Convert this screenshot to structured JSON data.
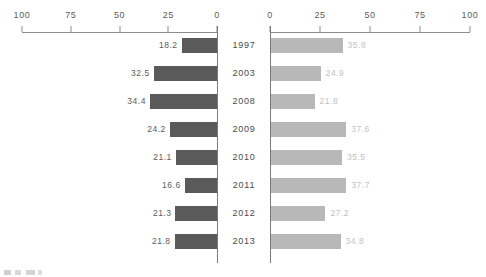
{
  "chart_data": {
    "type": "bar",
    "orientation": "horizontal-diverging",
    "title": "",
    "subtitle": "",
    "xlabel": "",
    "ylabel": "",
    "categories": [
      "1997",
      "2003",
      "2008",
      "2009",
      "2010",
      "2011",
      "2012",
      "2013"
    ],
    "series": [
      {
        "name": "left",
        "side": "left",
        "color": "#5a5a5a",
        "label_color": "#5c5c5c",
        "values": [
          18.2,
          32.5,
          34.4,
          24.2,
          21.1,
          16.6,
          21.3,
          21.8
        ],
        "value_labels": [
          "18.2",
          "32.5",
          "34.4",
          "24.2",
          "21.1",
          "16.6",
          "21.3",
          "21.8"
        ],
        "axis": {
          "min": 0,
          "max": 100,
          "direction": "right-to-left",
          "ticks": [
            100,
            75,
            50,
            25,
            0
          ],
          "tick_labels": [
            "100",
            "75",
            "50",
            "25",
            "0"
          ]
        }
      },
      {
        "name": "right",
        "side": "right",
        "color": "#b8b8b8",
        "label_color": "#c2c2c2",
        "values": [
          35.8,
          24.9,
          21.8,
          37.6,
          35.5,
          37.7,
          27.2,
          34.8
        ],
        "value_labels": [
          "35.8",
          "24.9",
          "21.8",
          "37.6",
          "35.5",
          "37.7",
          "27.2",
          "34.8"
        ],
        "axis": {
          "min": 0,
          "max": 100,
          "direction": "left-to-right",
          "ticks": [
            0,
            25,
            50,
            75,
            100
          ],
          "tick_labels": [
            "0",
            "25",
            "50",
            "75",
            "100"
          ]
        }
      }
    ],
    "grid": false,
    "legend": null,
    "xlim": [
      0,
      100
    ]
  }
}
